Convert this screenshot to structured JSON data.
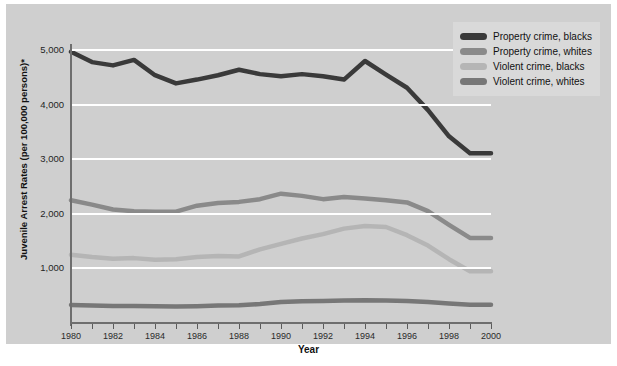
{
  "chart_data": {
    "type": "line",
    "title": "",
    "xlabel": "Year",
    "ylabel": "Juvenile Arrest Rates (per 100,000 persons)*",
    "xlim": [
      1980,
      2000
    ],
    "ylim": [
      0,
      5000
    ],
    "grid": true,
    "legend_position": "top-right",
    "x": [
      1980,
      1981,
      1982,
      1983,
      1984,
      1985,
      1986,
      1987,
      1988,
      1989,
      1990,
      1991,
      1992,
      1993,
      1994,
      1995,
      1996,
      1997,
      1998,
      1999,
      2000
    ],
    "xtick_labels": [
      "1980",
      "1982",
      "1984",
      "1986",
      "1988",
      "1990",
      "1992",
      "1994",
      "1996",
      "1998",
      "2000"
    ],
    "ytick_labels": [
      "1,000",
      "2,000",
      "3,000",
      "4,000",
      "5,000"
    ],
    "ytick_values": [
      1000,
      2000,
      3000,
      4000,
      5000
    ],
    "series": [
      {
        "name": "Property crime, blacks",
        "color": "#3a3a3a",
        "values": [
          4950,
          4760,
          4700,
          4800,
          4520,
          4370,
          4440,
          4520,
          4620,
          4540,
          4500,
          4540,
          4500,
          4440,
          4780,
          4530,
          4290,
          3880,
          3400,
          3090,
          3090
        ]
      },
      {
        "name": "Property crime, whites",
        "color": "#8a8a8a",
        "values": [
          2230,
          2150,
          2060,
          2030,
          2020,
          2020,
          2130,
          2180,
          2200,
          2250,
          2350,
          2310,
          2250,
          2290,
          2260,
          2230,
          2190,
          2030,
          1780,
          1540,
          1540
        ]
      },
      {
        "name": "Violent crime, blacks",
        "color": "#b5b5b5",
        "values": [
          1230,
          1190,
          1160,
          1170,
          1140,
          1150,
          1190,
          1210,
          1200,
          1330,
          1430,
          1530,
          1610,
          1710,
          1760,
          1740,
          1590,
          1400,
          1150,
          930,
          930
        ]
      },
      {
        "name": "Violent crime, whites",
        "color": "#777777",
        "values": [
          310,
          300,
          295,
          292,
          288,
          285,
          290,
          300,
          305,
          330,
          365,
          380,
          385,
          395,
          400,
          395,
          385,
          365,
          340,
          318,
          318
        ]
      }
    ]
  },
  "legend": {
    "items": [
      {
        "label": "Property crime, blacks",
        "color": "#3a3a3a"
      },
      {
        "label": "Property crime, whites",
        "color": "#8a8a8a"
      },
      {
        "label": "Violent crime, blacks",
        "color": "#b5b5b5"
      },
      {
        "label": "Violent crime, whites",
        "color": "#777777"
      }
    ]
  }
}
